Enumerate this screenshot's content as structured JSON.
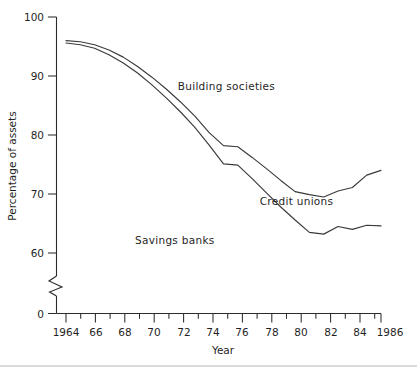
{
  "chart_data": {
    "type": "line",
    "title": "",
    "xlabel": "Year",
    "ylabel": "Percentage of assets",
    "xlim": [
      1963.4,
      1986.4
    ],
    "ylim": [
      55,
      100
    ],
    "y_axis_break": true,
    "y_axis_break_note": "axis broken between 0 and 60",
    "grid": false,
    "legend_position": "inline-annotations",
    "y_ticks": [
      0,
      60,
      70,
      80,
      90,
      100
    ],
    "y_tick_labels": [
      "0",
      "60",
      "70",
      "80",
      "90",
      "100"
    ],
    "x_ticks": [
      1964,
      1965,
      1966,
      1967,
      1968,
      1969,
      1970,
      1971,
      1972,
      1973,
      1974,
      1975,
      1976,
      1977,
      1978,
      1979,
      1980,
      1981,
      1982,
      1983,
      1984,
      1985,
      1986
    ],
    "x_tick_labels": [
      "1964",
      "66",
      "68",
      "70",
      "72",
      "74",
      "76",
      "78",
      "80",
      "82",
      "84",
      "1986"
    ],
    "x_labeled_ticks": [
      1964,
      1966,
      1968,
      1970,
      1972,
      1974,
      1976,
      1978,
      1980,
      1982,
      1984,
      1986
    ],
    "x": [
      1964,
      1965,
      1966,
      1967,
      1968,
      1969,
      1970,
      1971,
      1972,
      1973,
      1974,
      1975,
      1976,
      1977,
      1978,
      1979,
      1980,
      1981,
      1982,
      1983,
      1984,
      1985,
      1986
    ],
    "series": [
      {
        "name": "Building societies",
        "label": "Building societies",
        "label_x": 1975.2,
        "label_y": 87.6,
        "color": "#3a3a3a",
        "values": [
          96.0,
          95.8,
          95.3,
          94.4,
          93.2,
          91.6,
          89.8,
          87.8,
          85.6,
          83.2,
          80.4,
          78.2,
          78.0,
          76.2,
          74.3,
          72.3,
          70.4,
          69.9,
          69.5,
          70.5,
          71.1,
          73.2,
          74.0
        ]
      },
      {
        "name": "Credit unions",
        "label": "Credit unions",
        "label_x": 1980.1,
        "label_y": 68.1,
        "color": "#3a3a3a",
        "values": [
          95.6,
          95.3,
          94.7,
          93.6,
          92.2,
          90.5,
          88.5,
          86.3,
          83.9,
          81.3,
          78.3,
          75.1,
          74.9,
          72.6,
          70.2,
          67.8,
          65.6,
          63.5,
          63.2,
          64.5,
          64.0,
          64.7,
          64.6
        ]
      }
    ],
    "annotations": [
      {
        "text": "Savings banks",
        "x": 1971.6,
        "y": 61.6
      }
    ]
  }
}
